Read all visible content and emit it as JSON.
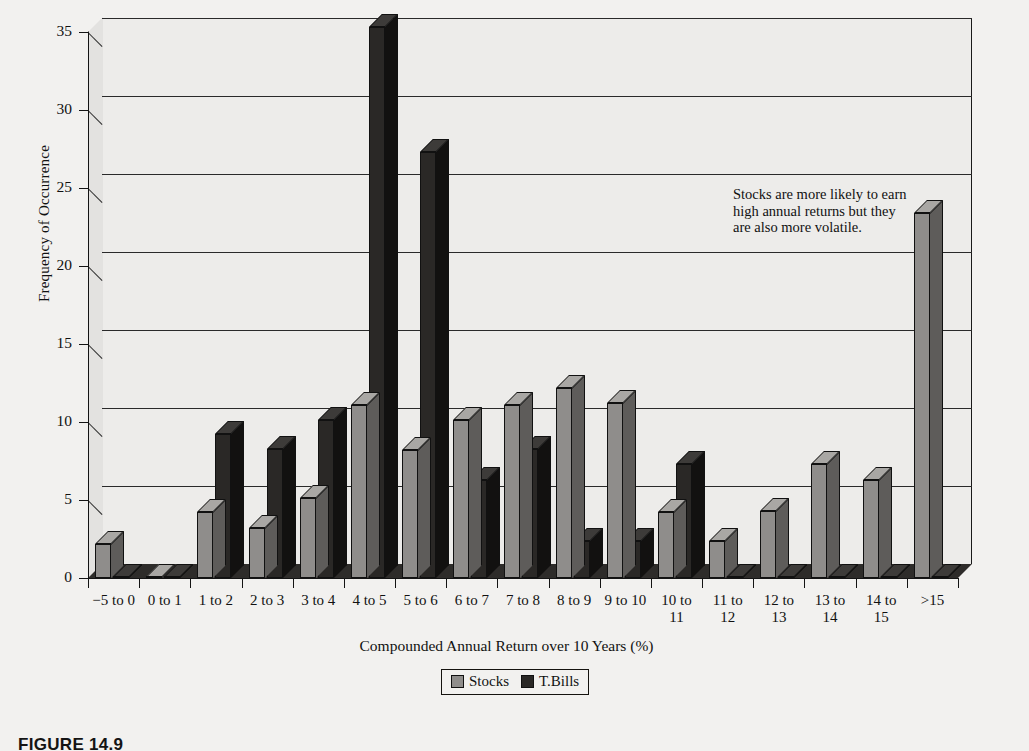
{
  "figure": {
    "caption": "FIGURE 14.9"
  },
  "annotation": {
    "line1": "Stocks are more likely to earn",
    "line2": "high annual returns but they",
    "line3": "are also more volatile."
  },
  "legend": {
    "position": "bottom-center",
    "entries": [
      {
        "label": "Stocks",
        "color": "#8f8d8b"
      },
      {
        "label": "T.Bills",
        "color": "#2a2826"
      }
    ]
  },
  "axes": {
    "y_title": "Frequency of Occurrence",
    "x_title": "Compounded Annual Return over 10 Years (%)",
    "y_ticks": [
      "0",
      "5",
      "10",
      "15",
      "20",
      "25",
      "30",
      "35"
    ]
  },
  "chart_data": {
    "type": "bar",
    "title": "",
    "subtitle": "",
    "xlabel": "Compounded Annual Return over 10 Years (%)",
    "ylabel": "Frequency of Occurrence",
    "ylim": [
      0,
      35
    ],
    "ytick_step": 5,
    "grid": true,
    "legend_position": "bottom-center",
    "three_d": true,
    "annotations": [
      "Stocks are more likely to earn high annual returns but they are also more volatile."
    ],
    "categories": [
      "−5 to 0",
      "0 to 1",
      "1 to 2",
      "2 to 3",
      "3 to 4",
      "4 to 5",
      "5 to 6",
      "6 to 7",
      "7 to 8",
      "8 to 9",
      "9 to 10",
      "10 to 11",
      "11 to 12",
      "12 to 13",
      "13 to 14",
      "14 to 15",
      ">15"
    ],
    "category_lines": [
      [
        "−5 to 0"
      ],
      [
        "0 to 1"
      ],
      [
        "1 to 2"
      ],
      [
        "2 to 3"
      ],
      [
        "3 to 4"
      ],
      [
        "4 to 5"
      ],
      [
        "5 to 6"
      ],
      [
        "6 to 7"
      ],
      [
        "7 to 8"
      ],
      [
        "8 to 9"
      ],
      [
        "9 to 10"
      ],
      [
        "10 to",
        "11"
      ],
      [
        "11 to",
        "12"
      ],
      [
        "12 to",
        "13"
      ],
      [
        "13 to",
        "14"
      ],
      [
        "14 to",
        "15"
      ],
      [
        ">15"
      ]
    ],
    "series": [
      {
        "name": "Stocks",
        "color": "#8f8d8b",
        "values": [
          2.2,
          0.0,
          4.2,
          3.2,
          5.1,
          11.1,
          8.2,
          10.1,
          11.1,
          12.2,
          11.2,
          4.2,
          2.4,
          4.3,
          7.3,
          6.3,
          23.4
        ]
      },
      {
        "name": "T.Bills",
        "color": "#2a2826",
        "values": [
          0.0,
          0.0,
          9.2,
          8.3,
          10.1,
          35.3,
          27.3,
          6.3,
          8.3,
          2.4,
          2.4,
          7.3,
          0.0,
          0.0,
          0.0,
          0.0,
          0.0
        ]
      }
    ]
  }
}
